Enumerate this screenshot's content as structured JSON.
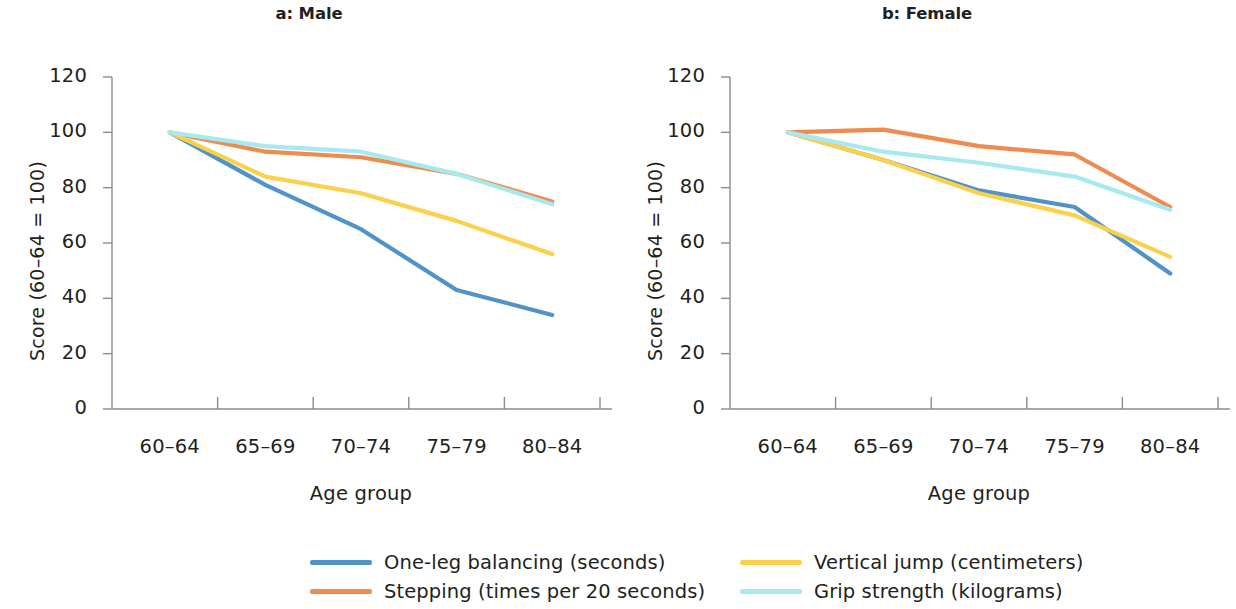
{
  "figure": {
    "background": "#ffffff"
  },
  "colors": {
    "one_leg_balancing": "#4f93c9",
    "stepping": "#ef8b4f",
    "vertical_jump": "#fbd14b",
    "grip_strength": "#a8e8ef",
    "axis": "#8c8c8c",
    "text": "#231f20"
  },
  "legend": {
    "position": "bottom",
    "items": [
      {
        "label": "One-leg balancing (seconds)",
        "color": "#4f93c9"
      },
      {
        "label": "Stepping (times per 20 seconds)",
        "color": "#ef8b4f"
      },
      {
        "label": "Vertical jump (centimeters)",
        "color": "#fbd14b"
      },
      {
        "label": "Grip strength (kilograms)",
        "color": "#a8e8ef"
      }
    ]
  },
  "chart_data": [
    {
      "type": "line",
      "title": "a: Male",
      "xlabel": "Age group",
      "ylabel": "Score (60–64 = 100)",
      "categories": [
        "60–64",
        "65–69",
        "70–74",
        "75–79",
        "80–84"
      ],
      "ylim": [
        0,
        120
      ],
      "yticks": [
        0,
        20,
        40,
        60,
        80,
        100,
        120
      ],
      "grid": false,
      "legend": "bottom",
      "series": [
        {
          "name": "One-leg balancing (seconds)",
          "color": "#4f93c9",
          "values": [
            100,
            81,
            65,
            43,
            34
          ]
        },
        {
          "name": "Stepping (times per 20 seconds)",
          "color": "#ef8b4f",
          "values": [
            100,
            93,
            91,
            85,
            75
          ]
        },
        {
          "name": "Vertical jump (centimeters)",
          "color": "#fbd14b",
          "values": [
            100,
            84,
            78,
            68,
            56
          ]
        },
        {
          "name": "Grip strength (kilograms)",
          "color": "#a8e8ef",
          "values": [
            100,
            95,
            93,
            85,
            74
          ]
        }
      ]
    },
    {
      "type": "line",
      "title": "b: Female",
      "xlabel": "Age group",
      "ylabel": "Score (60–64 = 100)",
      "categories": [
        "60–64",
        "65–69",
        "70–74",
        "75–79",
        "80–84"
      ],
      "ylim": [
        0,
        120
      ],
      "yticks": [
        0,
        20,
        40,
        60,
        80,
        100,
        120
      ],
      "grid": false,
      "legend": "bottom",
      "series": [
        {
          "name": "One-leg balancing (seconds)",
          "color": "#4f93c9",
          "values": [
            100,
            90,
            79,
            73,
            49
          ]
        },
        {
          "name": "Stepping (times per 20 seconds)",
          "color": "#ef8b4f",
          "values": [
            100,
            101,
            95,
            92,
            73
          ]
        },
        {
          "name": "Vertical jump (centimeters)",
          "color": "#fbd14b",
          "values": [
            100,
            90,
            78,
            70,
            55
          ]
        },
        {
          "name": "Grip strength (kilograms)",
          "color": "#a8e8ef",
          "values": [
            100,
            93,
            89,
            84,
            72
          ]
        }
      ]
    }
  ]
}
